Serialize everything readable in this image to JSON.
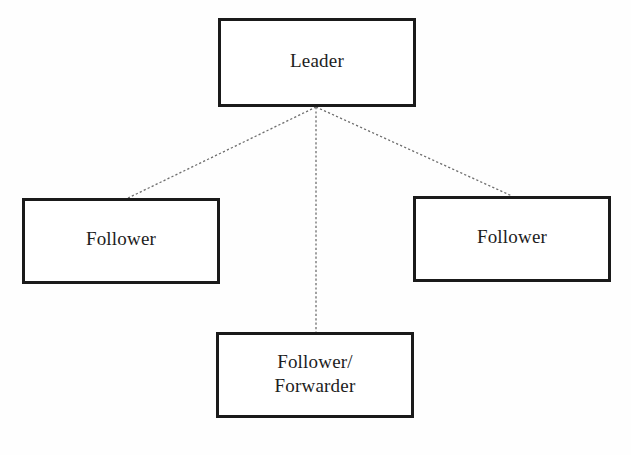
{
  "diagram": {
    "background_color": "#fefefe",
    "border_color": "#1a1a1a",
    "text_color": "#1d1d1d",
    "connector_color": "#6e6e6e",
    "connector_style": "dotted",
    "nodes": [
      {
        "id": "leader",
        "label": "Leader",
        "x": 218,
        "y": 18,
        "width": 198,
        "height": 89
      },
      {
        "id": "follower-left",
        "label": "Follower",
        "x": 22,
        "y": 198,
        "width": 198,
        "height": 86
      },
      {
        "id": "follower-right",
        "label": "Follower",
        "x": 413,
        "y": 196,
        "width": 198,
        "height": 86
      },
      {
        "id": "follower-forwarder",
        "label": "Follower/\nForwarder",
        "x": 216,
        "y": 332,
        "width": 198,
        "height": 86
      }
    ],
    "connectors": [
      {
        "id": "leader-to-follower-left",
        "from": "leader",
        "to": "follower-left",
        "x1": 316,
        "y1": 107,
        "x2": 128,
        "y2": 198
      },
      {
        "id": "leader-to-follower-right",
        "from": "leader",
        "to": "follower-right",
        "x1": 316,
        "y1": 107,
        "x2": 512,
        "y2": 196
      },
      {
        "id": "leader-to-follower-forwarder",
        "from": "leader",
        "to": "follower-forwarder",
        "x1": 316,
        "y1": 107,
        "x2": 316,
        "y2": 332
      }
    ]
  }
}
